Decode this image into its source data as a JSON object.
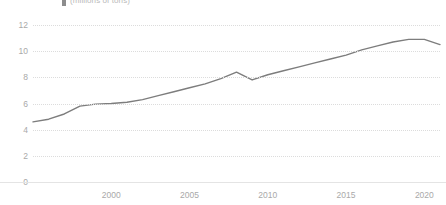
{
  "header": {
    "legend_marker": "series-color-swatch",
    "caption": "(millions of tons)"
  },
  "chart_data": {
    "type": "line",
    "title": "",
    "subtitle": "(millions of tons)",
    "xlabel": "",
    "ylabel": "",
    "xlim": [
      1995,
      2021
    ],
    "ylim": [
      0,
      12
    ],
    "grid": true,
    "legend_position": "top-left",
    "line_color": "#7d7d7d",
    "grid_color": "#dcdcdc",
    "tick_label_color": "#a9a9a9",
    "y_ticks": [
      0,
      2,
      4,
      6,
      8,
      10,
      12
    ],
    "x_ticks": [
      2000,
      2005,
      2010,
      2015,
      2020
    ],
    "x_tick_labels": [
      "2000",
      "2005",
      "2010",
      "2015",
      "2020"
    ],
    "y_tick_labels": [
      "0",
      "2",
      "4",
      "6",
      "8",
      "10",
      "12"
    ],
    "series": [
      {
        "name": "(millions of tons)",
        "x": [
          1995,
          1996,
          1997,
          1998,
          1999,
          2000,
          2001,
          2002,
          2003,
          2004,
          2005,
          2006,
          2007,
          2008,
          2009,
          2010,
          2011,
          2012,
          2013,
          2014,
          2015,
          2016,
          2017,
          2018,
          2019,
          2020,
          2021
        ],
        "values": [
          4.6,
          4.8,
          5.2,
          5.8,
          5.95,
          6.0,
          6.1,
          6.3,
          6.6,
          6.9,
          7.2,
          7.5,
          7.9,
          8.4,
          7.8,
          8.2,
          8.5,
          8.8,
          9.1,
          9.4,
          9.7,
          10.1,
          10.4,
          10.7,
          10.9,
          10.9,
          10.5
        ]
      }
    ]
  }
}
